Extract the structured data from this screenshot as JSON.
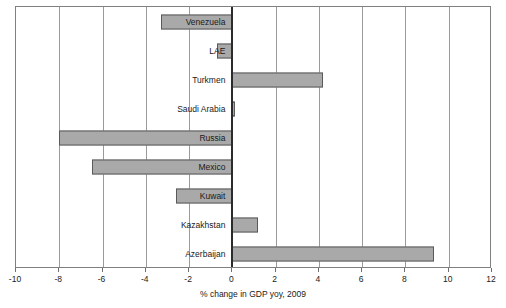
{
  "chart_data": {
    "type": "bar",
    "orientation": "horizontal",
    "title": "",
    "xlabel": "% change in GDP yoy, 2009",
    "ylabel": "",
    "xlim": [
      -10,
      12
    ],
    "xticks": [
      -10,
      -8,
      -6,
      -4,
      -2,
      0,
      2,
      4,
      6,
      8,
      10,
      12
    ],
    "xticklabels": [
      "-10",
      "-8",
      "-6",
      "-4",
      "-2",
      "0",
      "2",
      "4",
      "6",
      "8",
      "10",
      "12"
    ],
    "grid": "vertical",
    "legend": "none",
    "bar_color": "#a9a9a9",
    "bar_border_color": "#5a5a5a",
    "zero_line_color": "#2b2b2b",
    "categories": [
      "Venezuela",
      "LAE",
      "Turkmen",
      "Saudi Arabia",
      "Russia",
      "Mexico",
      "Kuwait",
      "Kazakhstan",
      "Azerbaijan"
    ],
    "values": [
      -3.3,
      -0.7,
      4.2,
      0.1,
      -8.0,
      -6.5,
      -2.6,
      1.2,
      9.3
    ],
    "bars": [
      {
        "label": "Venezuela",
        "value": -3.3
      },
      {
        "label": "LAE",
        "value": -0.7
      },
      {
        "label": "Turkmen",
        "value": 4.2
      },
      {
        "label": "Saudi Arabia",
        "value": 0.1
      },
      {
        "label": "Russia",
        "value": -8.0
      },
      {
        "label": "Mexico",
        "value": -6.5
      },
      {
        "label": "Kuwait",
        "value": -2.6
      },
      {
        "label": "Kazakhstan",
        "value": 1.2
      },
      {
        "label": "Azerbaijan",
        "value": 9.3
      }
    ]
  }
}
